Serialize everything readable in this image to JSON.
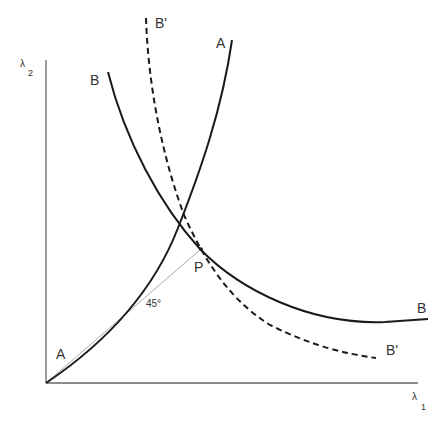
{
  "diagram": {
    "type": "indifference/offer curves with 45-degree line",
    "axes": {
      "y_label": "λ",
      "y_subscript": "2",
      "x_label": "λ",
      "x_subscript": "1"
    },
    "curves": [
      {
        "id": "A",
        "style": "solid",
        "label_top": "A",
        "label_bottom": "A"
      },
      {
        "id": "B",
        "style": "solid",
        "label_top": "B",
        "label_bottom": "B"
      },
      {
        "id": "B_prime",
        "style": "dashed",
        "label_top": "B'",
        "label_bottom": "B'"
      }
    ],
    "ray": {
      "label": "45°",
      "style": "thin gray"
    },
    "point": {
      "label": "P"
    },
    "colors": {
      "curve": "#1a1a1a",
      "axis": "#666666",
      "ray": "#aaaaaa",
      "text": "#333333"
    }
  }
}
